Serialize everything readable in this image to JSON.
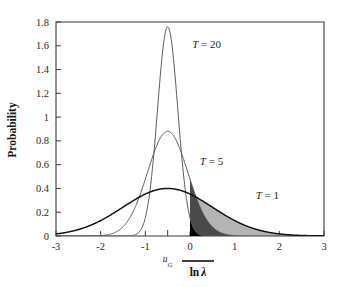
{
  "figure": {
    "background": "#ffffff"
  },
  "axes": {
    "y_title": "Probability",
    "x_title_prefix": "ln",
    "x_title_symbol": "λ",
    "x_title_overbar": true,
    "x_title_full": "ln λ̄",
    "x_ticks": [
      "-3",
      "-2",
      "-1",
      "0",
      "1",
      "2",
      "3"
    ],
    "x_tick_values": [
      -3,
      -2,
      -1,
      0,
      1,
      2,
      3
    ],
    "y_ticks": [
      "0",
      "0.2",
      "0.4",
      "0.6",
      "0.8",
      "1",
      "1.2",
      "1.4",
      "1.6",
      "1.8"
    ],
    "y_tick_values": [
      0,
      0.2,
      0.4,
      0.6,
      0.8,
      1,
      1.2,
      1.4,
      1.6,
      1.8
    ],
    "xlim": [
      -3,
      3
    ],
    "ylim": [
      0,
      1.8
    ],
    "grid": false
  },
  "annotations": {
    "ug": {
      "text": "u",
      "subscript": "G",
      "full": "u_G",
      "x_value": -0.5,
      "tick": true
    },
    "labels": [
      {
        "name": "T = 20",
        "var": "T",
        "eq": " = ",
        "value": "20",
        "x_value": 0.05,
        "y_value": 1.58
      },
      {
        "name": "T = 5",
        "var": "T",
        "eq": " = ",
        "value": "5",
        "x_value": 0.22,
        "y_value": 0.6
      },
      {
        "name": "T = 1",
        "var": "T",
        "eq": " = ",
        "value": "1",
        "x_value": 1.47,
        "y_value": 0.31
      }
    ]
  },
  "chart_data": {
    "type": "line",
    "title": "",
    "xlabel": "ln λ̄",
    "ylabel": "Probability",
    "xlim": [
      -3,
      3
    ],
    "ylim": [
      0,
      1.8
    ],
    "grid": false,
    "legend_position": "inline-annotations",
    "mean": -0.5,
    "shade_from": 0,
    "series": [
      {
        "name": "T = 20",
        "T": 20,
        "peak_x": -0.5,
        "peak_y": 1.76,
        "sigma": 0.2265,
        "line_color": "#5c5c5c",
        "tail_fill": "#000000",
        "tail_label": "black shaded tail right of 0",
        "x": [
          -3.0,
          -2.5,
          -2.0,
          -1.5,
          -1.2,
          -1.0,
          -0.9,
          -0.8,
          -0.7,
          -0.6,
          -0.5,
          -0.4,
          -0.3,
          -0.2,
          -0.1,
          0.0,
          0.2,
          0.4,
          0.6,
          0.8,
          1.0,
          1.5,
          2.0,
          2.5,
          3.0
        ],
        "y": [
          0.0,
          0.0,
          0.0,
          0.0,
          0.005,
          0.049,
          0.121,
          0.251,
          0.448,
          0.688,
          0.88,
          0.688,
          0.448,
          0.251,
          0.121,
          0.049,
          0.005,
          0.0,
          0.0,
          0.0,
          0.0,
          0.0,
          0.0,
          0.0,
          0.0
        ]
      },
      {
        "name": "T = 5",
        "T": 5,
        "peak_x": -0.5,
        "peak_y": 0.88,
        "sigma": 0.453,
        "line_color": "#5c5c5c",
        "tail_fill": "#4a4a4a",
        "tail_label": "dark grey shaded tail right of 0",
        "x": [
          -3.0,
          -2.5,
          -2.0,
          -1.6,
          -1.4,
          -1.2,
          -1.0,
          -0.8,
          -0.6,
          -0.5,
          -0.4,
          -0.2,
          0.0,
          0.2,
          0.4,
          0.6,
          0.8,
          1.0,
          1.4,
          1.8,
          2.2,
          2.6,
          3.0
        ],
        "y": [
          0.0,
          0.0,
          0.006,
          0.039,
          0.087,
          0.168,
          0.286,
          0.44,
          0.605,
          0.88,
          0.605,
          0.44,
          0.286,
          0.168,
          0.087,
          0.039,
          0.015,
          0.005,
          0.0,
          0.0,
          0.0,
          0.0,
          0.0
        ]
      },
      {
        "name": "T = 1",
        "T": 1,
        "peak_x": -0.5,
        "peak_y": 0.4,
        "sigma": 1.0,
        "line_color": "#141414",
        "tail_fill": "#b4b4b4",
        "tail_label": "light grey shaded tail right of 0",
        "x": [
          -3.0,
          -2.6,
          -2.2,
          -1.8,
          -1.4,
          -1.0,
          -0.6,
          -0.5,
          -0.4,
          0.0,
          0.4,
          0.8,
          1.2,
          1.6,
          2.0,
          2.4,
          2.6,
          3.0
        ],
        "y": [
          0.018,
          0.035,
          0.062,
          0.1,
          0.15,
          0.207,
          0.266,
          0.399,
          0.266,
          0.207,
          0.15,
          0.1,
          0.062,
          0.035,
          0.018,
          0.008,
          0.004,
          0.001
        ]
      }
    ]
  }
}
